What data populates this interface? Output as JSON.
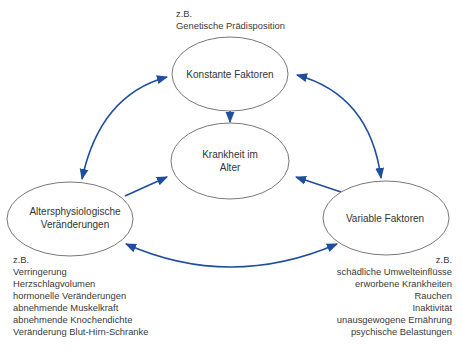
{
  "diagram": {
    "colors": {
      "arrow": "#1f4e9c",
      "ellipse_stroke": "#555555",
      "text": "#333333"
    },
    "nodes": {
      "konstant": {
        "label_lines": [
          "Konstante Faktoren"
        ]
      },
      "krankheit": {
        "label_lines": [
          "Krankheit im",
          "Alter"
        ]
      },
      "alters": {
        "label_lines": [
          "Altersphysiologische",
          "Veränderungen"
        ]
      },
      "variabel": {
        "label_lines": [
          "Variable Faktoren"
        ]
      }
    },
    "notes": {
      "konstant": {
        "lines": [
          "z.B.",
          "Genetische Prädisposition"
        ]
      },
      "alters": {
        "lines": [
          "z.B.",
          "Verringerung",
          "Herzschlagvolumen",
          "hormonelle Veränderungen",
          "abnehmende Muskelkraft",
          "abnehmende Knochendichte",
          "Veränderung Blut-Hirn-Schranke"
        ]
      },
      "variabel": {
        "lines": [
          "z.B.",
          "schädliche Umwelteinflüsse",
          "erworbene Krankheiten",
          "Rauchen",
          "Inaktivität",
          "unausgewogene Ernährung",
          "psychische Belastungen"
        ]
      }
    },
    "edges": [
      {
        "from": "konstant",
        "to": "krankheit",
        "type": "directed"
      },
      {
        "from": "alters",
        "to": "krankheit",
        "type": "directed"
      },
      {
        "from": "variabel",
        "to": "krankheit",
        "type": "directed"
      },
      {
        "from": "konstant",
        "to": "alters",
        "type": "bidirectional"
      },
      {
        "from": "konstant",
        "to": "variabel",
        "type": "bidirectional"
      },
      {
        "from": "alters",
        "to": "variabel",
        "type": "bidirectional"
      }
    ]
  }
}
